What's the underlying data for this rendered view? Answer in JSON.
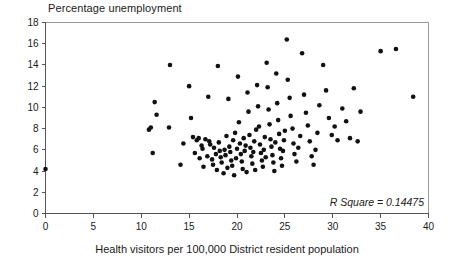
{
  "chart_data": {
    "type": "scatter",
    "title": "Percentage unemployment",
    "xlabel": "Health visitors per 100,000 District resident population",
    "ylabel": "Percentage unemployment",
    "xlim": [
      0,
      40
    ],
    "ylim": [
      0,
      18
    ],
    "xticks": [
      0,
      5,
      10,
      15,
      20,
      25,
      30,
      35,
      40
    ],
    "yticks": [
      0,
      2,
      4,
      6,
      8,
      10,
      12,
      14,
      16,
      18
    ],
    "grid": false,
    "legend": "none",
    "annotation": "R Square = 0.14475",
    "r_square": 0.14475,
    "marker": "filled-circle",
    "marker_color": "#111111",
    "points": [
      [
        0.0,
        4.2
      ],
      [
        10.8,
        7.9
      ],
      [
        11.0,
        8.1
      ],
      [
        11.2,
        5.7
      ],
      [
        11.4,
        10.5
      ],
      [
        11.6,
        9.3
      ],
      [
        12.9,
        8.1
      ],
      [
        13.0,
        14.0
      ],
      [
        14.1,
        4.6
      ],
      [
        14.4,
        6.6
      ],
      [
        15.0,
        12.0
      ],
      [
        15.2,
        9.0
      ],
      [
        15.4,
        7.2
      ],
      [
        15.6,
        5.7
      ],
      [
        15.8,
        6.9
      ],
      [
        16.0,
        7.1
      ],
      [
        16.1,
        5.2
      ],
      [
        16.3,
        6.4
      ],
      [
        16.4,
        6.1
      ],
      [
        16.5,
        4.4
      ],
      [
        16.7,
        7.0
      ],
      [
        16.9,
        5.4
      ],
      [
        17.0,
        11.0
      ],
      [
        17.1,
        6.8
      ],
      [
        17.2,
        6.5
      ],
      [
        17.4,
        5.1
      ],
      [
        17.5,
        4.6
      ],
      [
        17.6,
        6.2
      ],
      [
        17.8,
        5.6
      ],
      [
        17.9,
        4.1
      ],
      [
        18.0,
        13.9
      ],
      [
        18.1,
        6.7
      ],
      [
        18.2,
        5.9
      ],
      [
        18.3,
        5.3
      ],
      [
        18.4,
        4.8
      ],
      [
        18.6,
        3.8
      ],
      [
        18.7,
        6.0
      ],
      [
        18.8,
        5.5
      ],
      [
        18.9,
        7.3
      ],
      [
        19.0,
        4.3
      ],
      [
        19.1,
        10.8
      ],
      [
        19.2,
        6.3
      ],
      [
        19.3,
        5.8
      ],
      [
        19.4,
        5.0
      ],
      [
        19.5,
        4.5
      ],
      [
        19.6,
        6.9
      ],
      [
        19.7,
        3.6
      ],
      [
        19.8,
        7.6
      ],
      [
        19.9,
        5.2
      ],
      [
        20.0,
        6.1
      ],
      [
        20.1,
        12.9
      ],
      [
        20.2,
        8.6
      ],
      [
        20.3,
        6.6
      ],
      [
        20.4,
        5.6
      ],
      [
        20.5,
        4.9
      ],
      [
        20.6,
        4.2
      ],
      [
        20.7,
        7.1
      ],
      [
        20.8,
        5.9
      ],
      [
        20.9,
        6.4
      ],
      [
        21.0,
        3.9
      ],
      [
        21.1,
        11.4
      ],
      [
        21.2,
        9.6
      ],
      [
        21.3,
        7.4
      ],
      [
        21.4,
        6.2
      ],
      [
        21.5,
        5.4
      ],
      [
        21.6,
        4.7
      ],
      [
        21.7,
        5.8
      ],
      [
        21.8,
        6.8
      ],
      [
        21.9,
        4.1
      ],
      [
        22.0,
        7.9
      ],
      [
        22.1,
        12.1
      ],
      [
        22.2,
        10.1
      ],
      [
        22.3,
        8.2
      ],
      [
        22.4,
        6.5
      ],
      [
        22.5,
        5.7
      ],
      [
        22.6,
        5.0
      ],
      [
        22.7,
        4.4
      ],
      [
        22.8,
        6.0
      ],
      [
        22.9,
        7.2
      ],
      [
        23.0,
        5.3
      ],
      [
        23.1,
        14.2
      ],
      [
        23.2,
        11.9
      ],
      [
        23.3,
        9.8
      ],
      [
        23.4,
        8.4
      ],
      [
        23.5,
        7.0
      ],
      [
        23.6,
        6.3
      ],
      [
        23.7,
        5.5
      ],
      [
        23.8,
        4.8
      ],
      [
        23.9,
        4.0
      ],
      [
        24.0,
        6.7
      ],
      [
        24.1,
        13.2
      ],
      [
        24.2,
        10.4
      ],
      [
        24.3,
        8.8
      ],
      [
        24.4,
        7.5
      ],
      [
        24.5,
        6.1
      ],
      [
        24.6,
        5.2
      ],
      [
        24.7,
        4.5
      ],
      [
        24.8,
        5.9
      ],
      [
        24.9,
        6.9
      ],
      [
        25.0,
        7.8
      ],
      [
        25.2,
        16.4
      ],
      [
        25.3,
        12.6
      ],
      [
        25.5,
        10.9
      ],
      [
        25.6,
        9.2
      ],
      [
        25.8,
        8.0
      ],
      [
        25.9,
        6.6
      ],
      [
        26.0,
        5.6
      ],
      [
        26.2,
        4.9
      ],
      [
        26.4,
        6.2
      ],
      [
        26.6,
        7.3
      ],
      [
        26.8,
        15.1
      ],
      [
        27.0,
        11.2
      ],
      [
        27.2,
        9.5
      ],
      [
        27.4,
        8.3
      ],
      [
        27.6,
        6.8
      ],
      [
        27.8,
        5.4
      ],
      [
        28.0,
        4.6
      ],
      [
        28.2,
        6.0
      ],
      [
        28.4,
        7.6
      ],
      [
        28.6,
        10.2
      ],
      [
        29.0,
        14.0
      ],
      [
        29.3,
        11.6
      ],
      [
        29.6,
        9.0
      ],
      [
        29.9,
        7.4
      ],
      [
        30.2,
        8.2
      ],
      [
        30.5,
        6.9
      ],
      [
        31.0,
        9.9
      ],
      [
        31.4,
        8.7
      ],
      [
        31.8,
        7.1
      ],
      [
        32.2,
        11.8
      ],
      [
        32.6,
        6.8
      ],
      [
        32.9,
        9.6
      ],
      [
        35.0,
        15.3
      ],
      [
        36.6,
        15.5
      ],
      [
        38.4,
        11.0
      ]
    ]
  }
}
